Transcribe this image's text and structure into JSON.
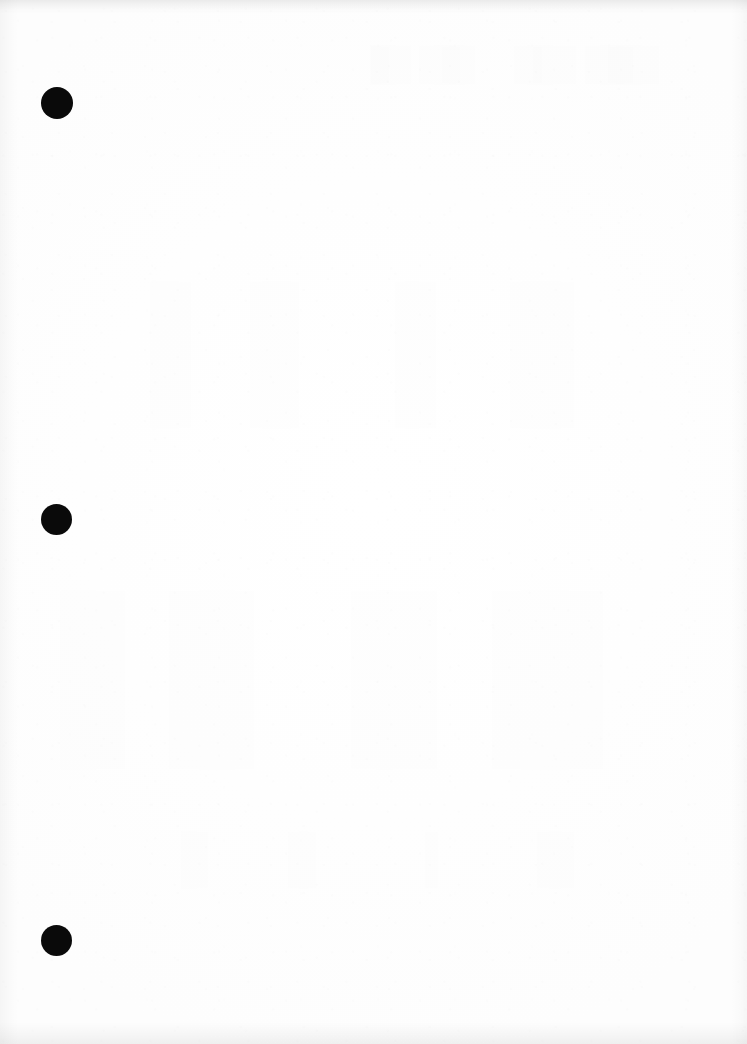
{
  "document": {
    "kind": "scanned-page",
    "page_label": "",
    "width_px": 747,
    "height_px": 1044,
    "background_color": "#fefefe",
    "text_content": "",
    "is_blank": true
  },
  "marks": {
    "color": "#0a0a0a",
    "shape": "filled-circle",
    "count": 3,
    "dots": [
      {
        "name": "binding-dot-1",
        "cx": 57,
        "cy": 103,
        "d": 32
      },
      {
        "name": "binding-dot-2",
        "cx": 56,
        "cy": 519,
        "d": 31
      },
      {
        "name": "binding-dot-3",
        "cx": 56,
        "cy": 940,
        "d": 31
      }
    ]
  },
  "scan_artifacts": {
    "edge_shadow_color": "#e8e8e8",
    "top_band_height": 14,
    "bottom_band_height": 22,
    "left_band_width": 18,
    "right_band_width": 16,
    "bleed_through_regions": [
      {
        "name": "bleed-top",
        "x": 370,
        "y": 45,
        "w": 320,
        "h": 40
      },
      {
        "name": "bleed-upper-mid",
        "x": 150,
        "y": 280,
        "w": 500,
        "h": 150
      },
      {
        "name": "bleed-lower-mid",
        "x": 60,
        "y": 590,
        "w": 620,
        "h": 180
      },
      {
        "name": "bleed-lower",
        "x": 180,
        "y": 830,
        "w": 480,
        "h": 60
      }
    ]
  }
}
